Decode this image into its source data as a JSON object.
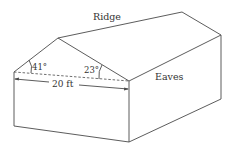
{
  "labels": {
    "ridge": "Ridge",
    "eaves": "Eaves",
    "left_angle": "41°",
    "right_angle": "23°",
    "width": "20 ft"
  },
  "colors": {
    "line": "#4a4a4a",
    "text": "#333333",
    "background": "#ffffff"
  }
}
